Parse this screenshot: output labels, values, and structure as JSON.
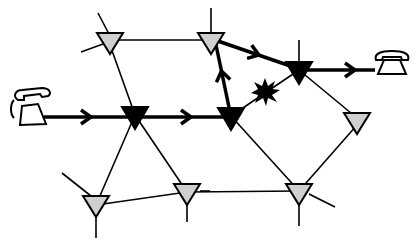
{
  "diagram": {
    "colors": {
      "background": "#ffffff",
      "line": "#000000",
      "active_node": "#000000",
      "idle_node": "#cfcfcf"
    },
    "nodes": [
      {
        "id": "A",
        "type": "idle",
        "x": 110,
        "y": 33
      },
      {
        "id": "B",
        "type": "idle",
        "x": 211,
        "y": 33
      },
      {
        "id": "C",
        "type": "active",
        "x": 135,
        "y": 107
      },
      {
        "id": "D",
        "type": "active",
        "x": 231,
        "y": 108
      },
      {
        "id": "E",
        "type": "active",
        "x": 299,
        "y": 62
      },
      {
        "id": "F",
        "type": "idle",
        "x": 357,
        "y": 113
      },
      {
        "id": "G",
        "type": "idle",
        "x": 96,
        "y": 196
      },
      {
        "id": "H",
        "type": "idle",
        "x": 187,
        "y": 184
      },
      {
        "id": "I",
        "type": "idle",
        "x": 299,
        "y": 184
      }
    ],
    "endpoints": [
      {
        "id": "phone-left",
        "icon": "telephone-icon",
        "x": 26,
        "y": 108
      },
      {
        "id": "phone-right",
        "icon": "telephone-icon",
        "x": 392,
        "y": 62
      }
    ],
    "failure": {
      "icon": "explosion-icon",
      "x": 265,
      "y": 92,
      "link": "D-E"
    },
    "call_path": [
      "phone-left",
      "C",
      "D",
      "B",
      "E",
      "phone-right"
    ]
  }
}
